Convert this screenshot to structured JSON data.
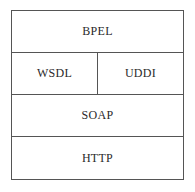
{
  "diagram": {
    "type": "protocol-stack",
    "layers": [
      {
        "cells": [
          {
            "label": "BPEL"
          }
        ]
      },
      {
        "cells": [
          {
            "label": "WSDL"
          },
          {
            "label": "UDDI"
          }
        ]
      },
      {
        "cells": [
          {
            "label": "SOAP"
          }
        ]
      },
      {
        "cells": [
          {
            "label": "HTTP"
          }
        ]
      }
    ],
    "colors": {
      "border": "#555555",
      "text": "#2a2a2a",
      "background": "#ffffff"
    }
  }
}
